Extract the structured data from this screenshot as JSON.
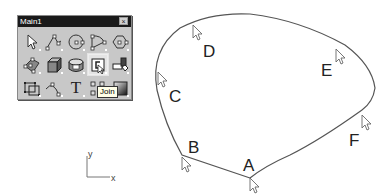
{
  "toolbar": {
    "title": "Main1",
    "close_label": "×",
    "tooltip": "Join",
    "buttons": [
      {
        "icon": "select-arrow-icon"
      },
      {
        "icon": "polyline-icon"
      },
      {
        "icon": "circle-icon"
      },
      {
        "icon": "curve-icon"
      },
      {
        "icon": "polygon-icon"
      },
      {
        "icon": "surface-icon"
      },
      {
        "icon": "box-icon"
      },
      {
        "icon": "cylinder-icon"
      },
      {
        "icon": "join-icon",
        "active": true
      },
      {
        "icon": "boolean-icon"
      },
      {
        "icon": "group-icon"
      },
      {
        "icon": "curve-points-icon"
      },
      {
        "icon": "text-icon",
        "glyph": "T"
      },
      {
        "icon": "grid-snap-icon"
      },
      {
        "icon": "shade-icon"
      }
    ]
  },
  "diagram": {
    "points": [
      {
        "label": "A",
        "x": 250,
        "y": 178
      },
      {
        "label": "B",
        "x": 182,
        "y": 155
      },
      {
        "label": "C",
        "x": 157,
        "y": 76
      },
      {
        "label": "D",
        "x": 193,
        "y": 26
      },
      {
        "label": "E",
        "x": 336,
        "y": 52
      },
      {
        "label": "F",
        "x": 362,
        "y": 110
      }
    ],
    "axes": {
      "x_label": "x",
      "y_label": "y"
    }
  }
}
